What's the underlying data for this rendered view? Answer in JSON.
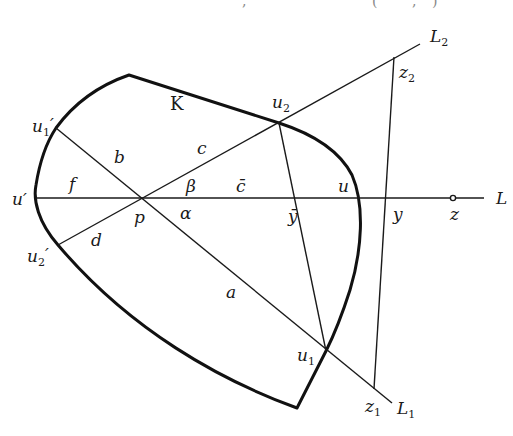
{
  "figure": {
    "type": "geometric-construction",
    "top_fragments": [
      ",",
      "(",
      ",",
      ")"
    ],
    "body": {
      "label": "K",
      "description": "convex body K"
    },
    "lines": {
      "L": "L",
      "L1": "L",
      "L1_sub": "1",
      "L2": "L",
      "L2_sub": "2"
    },
    "points": {
      "p": "p",
      "u": "u",
      "u_prime": "u′",
      "u1": "u",
      "u1_sub": "1",
      "u2": "u",
      "u2_sub": "2",
      "u1_prime": "u",
      "u1_prime_sub": "1",
      "u1_prime_mark": "′",
      "u2_prime": "u",
      "u2_prime_sub": "2",
      "u2_prime_mark": "′",
      "y": "y",
      "y_bar": "ȳ",
      "z": "z",
      "z1": "z",
      "z1_sub": "1",
      "z2": "z",
      "z2_sub": "2"
    },
    "segments": {
      "a": "a",
      "b": "b",
      "c": "c",
      "c_bar": "c̄",
      "d": "d",
      "f": "f"
    },
    "angles": {
      "alpha": "α",
      "beta": "β"
    }
  }
}
